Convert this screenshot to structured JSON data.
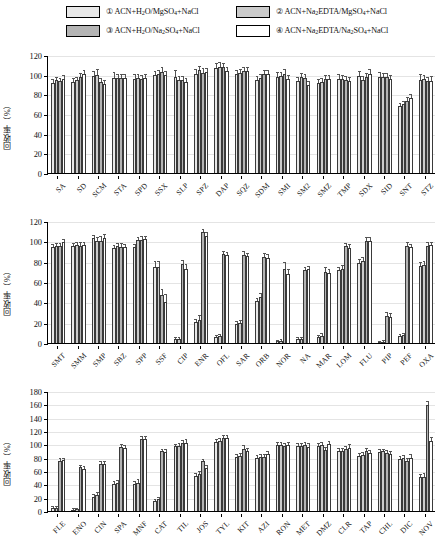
{
  "legend": {
    "items": [
      {
        "id": "1",
        "marker": "①",
        "label": "ACN+H2O/MgSO4+NaCl",
        "html": "① ACN+H<sub>2</sub>O/MgSO<sub>4</sub>+NaCl",
        "color": "#e8e8e8"
      },
      {
        "id": "3",
        "marker": "③",
        "label": "ACN+H2O/Na2SO4+NaCl",
        "html": "③ ACN+H<sub>2</sub>O/Na<sub>2</sub>SO<sub>4</sub>+NaCl",
        "color": "#b4b4b4"
      },
      {
        "id": "2",
        "marker": "②",
        "label": "ACN+Na2EDTA/MgSO4+NaCl",
        "html": "② ACN+Na<sub>2</sub>EDTA/MgSO<sub>4</sub>+NaCl",
        "color": "#cbcbcb"
      },
      {
        "id": "4",
        "marker": "④",
        "label": "ACN+Na2EDTA/Na2SO4+NaCl",
        "html": "④ ACN+Na<sub>2</sub>EDTA/Na<sub>2</sub>SO<sub>4</sub>+NaCl",
        "color": "#ffffff"
      }
    ]
  },
  "series_order": [
    "1",
    "2",
    "3",
    "4"
  ],
  "series_colors": [
    "#e8e8e8",
    "#cbcbcb",
    "#b4b4b4",
    "#ffffff"
  ],
  "ylabel": "回收率（%）",
  "chart_data": [
    {
      "type": "bar",
      "title": "",
      "xlabel": "",
      "ylabel": "回收率（%）",
      "ylim": [
        0,
        120
      ],
      "yticks": [
        0,
        20,
        40,
        60,
        80,
        100,
        120
      ],
      "grid": true,
      "legend_position": "top",
      "categories": [
        "SA",
        "SD",
        "SCM",
        "STA",
        "SPD",
        "SSX",
        "SLP",
        "SPZ",
        "DAP",
        "SQZ",
        "SDM",
        "SMI",
        "SM2",
        "SMZ",
        "TMP",
        "SDX",
        "SID",
        "SNT",
        "STZ"
      ],
      "series": [
        {
          "name": "① ACN+H2O/MgSO4+NaCl",
          "values": [
            91.5,
            93.0,
            98.5,
            97.0,
            96.0,
            99.5,
            98.0,
            101.0,
            107.0,
            100.5,
            95.0,
            98.0,
            93.5,
            92.0,
            96.0,
            99.0,
            98.0,
            68.5,
            95.0
          ]
        },
        {
          "name": "② ACN+Na2EDTA/MgSO4+NaCl",
          "values": [
            94.5,
            94.5,
            100.0,
            96.5,
            96.5,
            101.0,
            94.5,
            104.5,
            108.0,
            102.0,
            97.0,
            98.5,
            97.5,
            93.0,
            96.0,
            95.0,
            98.0,
            70.5,
            95.5
          ]
        },
        {
          "name": "③ ACN+H2O/Na2SO4+NaCl",
          "values": [
            93.5,
            97.5,
            92.5,
            97.0,
            95.5,
            103.0,
            94.5,
            102.0,
            107.5,
            103.5,
            101.0,
            101.0,
            96.5,
            95.5,
            94.5,
            97.5,
            97.5,
            73.5,
            94.0
          ]
        },
        {
          "name": "④ ACN+Na2EDTA/Na2SO4+NaCl",
          "values": [
            96.0,
            100.5,
            91.0,
            96.5,
            96.5,
            100.0,
            93.0,
            103.0,
            104.0,
            103.5,
            100.5,
            96.0,
            89.5,
            96.0,
            94.0,
            100.5,
            95.5,
            76.0,
            94.0
          ]
        }
      ],
      "errors": [
        [
          3.0,
          2.5,
          4.0,
          5.0,
          4.0,
          3.5,
          5.5,
          3.5,
          3.5,
          3.0,
          3.0,
          3.5,
          3.0,
          3.0,
          3.5,
          4.0,
          4.0,
          2.0,
          5.0
        ],
        [
          2.5,
          2.5,
          4.5,
          3.0,
          3.0,
          3.0,
          3.5,
          3.5,
          3.5,
          3.0,
          3.0,
          3.0,
          3.0,
          3.0,
          3.0,
          3.0,
          3.0,
          2.0,
          3.5
        ],
        [
          2.5,
          3.0,
          3.0,
          3.0,
          3.0,
          4.0,
          3.5,
          3.5,
          3.5,
          3.0,
          3.0,
          3.5,
          3.0,
          3.0,
          3.0,
          3.0,
          3.5,
          2.5,
          3.0
        ],
        [
          2.5,
          3.0,
          3.0,
          3.0,
          3.0,
          3.0,
          3.0,
          3.0,
          3.0,
          3.5,
          3.0,
          3.0,
          3.0,
          3.0,
          3.0,
          4.0,
          3.0,
          3.5,
          3.5
        ]
      ]
    },
    {
      "type": "bar",
      "title": "",
      "xlabel": "",
      "ylabel": "回收率（%）",
      "ylim": [
        0,
        120
      ],
      "yticks": [
        0,
        20,
        40,
        60,
        80,
        100,
        120
      ],
      "grid": true,
      "legend_position": "top",
      "categories": [
        "SMT",
        "SMM",
        "SMP",
        "SBZ",
        "SPP",
        "SSF",
        "CIP",
        "ENR",
        "OFL",
        "SAR",
        "ORB",
        "NOR",
        "NA",
        "MAR",
        "LOM",
        "FLU",
        "PIP",
        "PEF",
        "OXA"
      ],
      "series": [
        {
          "name": "① ACN+H2O/MgSO4+NaCl",
          "values": [
            94.5,
            95.5,
            103.0,
            93.0,
            94.0,
            74.5,
            3.5,
            20.5,
            6.0,
            19.0,
            41.0,
            1.5,
            3.5,
            5.5,
            71.5,
            79.0,
            0.8,
            6.5,
            75.5
          ]
        },
        {
          "name": "② ACN+Na2EDTA/MgSO4+NaCl",
          "values": [
            95.0,
            96.5,
            100.5,
            95.0,
            101.0,
            75.0,
            4.0,
            22.5,
            6.5,
            20.0,
            45.0,
            2.0,
            3.5,
            7.0,
            73.0,
            80.5,
            1.0,
            7.5,
            76.5
          ]
        },
        {
          "name": "③ ACN+H2O/Na2SO4+NaCl",
          "values": [
            95.0,
            95.5,
            100.5,
            94.5,
            101.5,
            47.0,
            77.5,
            109.5,
            87.5,
            86.5,
            85.0,
            72.5,
            71.5,
            69.5,
            95.0,
            100.5,
            26.5,
            95.5,
            95.5
          ]
        },
        {
          "name": "④ ACN+Na2EDTA/Na2SO4+NaCl",
          "values": [
            99.0,
            96.0,
            103.0,
            94.5,
            102.0,
            40.5,
            73.0,
            105.5,
            87.0,
            85.5,
            84.0,
            67.5,
            72.5,
            68.5,
            93.5,
            100.5,
            26.0,
            94.0,
            96.0
          ]
        }
      ],
      "errors": [
        [
          2.0,
          2.0,
          2.5,
          2.0,
          2.0,
          5.0,
          1.0,
          2.5,
          1.0,
          1.5,
          2.0,
          0.8,
          1.0,
          1.5,
          2.5,
          3.0,
          0.5,
          1.5,
          3.0
        ],
        [
          2.0,
          2.0,
          3.0,
          2.0,
          2.5,
          5.0,
          1.0,
          4.0,
          1.0,
          1.5,
          3.5,
          0.8,
          1.0,
          1.5,
          2.5,
          3.0,
          0.5,
          1.5,
          3.0
        ],
        [
          2.0,
          2.5,
          3.5,
          2.5,
          2.5,
          5.5,
          3.5,
          2.0,
          2.0,
          3.0,
          2.5,
          6.0,
          2.0,
          4.0,
          2.5,
          2.5,
          3.0,
          2.5,
          2.5
        ],
        [
          2.0,
          2.0,
          3.0,
          2.0,
          2.0,
          6.5,
          3.5,
          2.5,
          2.0,
          2.5,
          2.5,
          4.5,
          2.5,
          3.5,
          2.5,
          2.5,
          3.0,
          2.0,
          2.0
        ]
      ]
    },
    {
      "type": "bar",
      "title": "",
      "xlabel": "",
      "ylabel": "回收率（%）",
      "ylim": [
        0,
        180
      ],
      "yticks": [
        0,
        20,
        40,
        60,
        80,
        100,
        120,
        140,
        160,
        180
      ],
      "grid": true,
      "legend_position": "top",
      "categories": [
        "FLE",
        "ENO",
        "CIN",
        "SPA",
        "MNF",
        "CAT",
        "TIL",
        "JOS",
        "TYL",
        "KIT",
        "AZI",
        "RON",
        "MET",
        "DMZ",
        "CLR",
        "TAP",
        "CHL",
        "DIC",
        "NOV"
      ],
      "series": [
        {
          "name": "① ACN+H2O/MgSO4+NaCl",
          "values": [
            4.5,
            2.0,
            21.5,
            40.0,
            40.0,
            15.5,
            97.0,
            53.0,
            103.0,
            81.5,
            80.0,
            98.5,
            97.5,
            97.5,
            90.5,
            83.0,
            88.5,
            78.5,
            50.5
          ]
        },
        {
          "name": "② ACN+Na2EDTA/MgSO4+NaCl",
          "values": [
            5.0,
            2.5,
            24.0,
            41.5,
            42.5,
            17.5,
            98.0,
            55.5,
            104.5,
            82.5,
            81.0,
            98.5,
            98.0,
            98.5,
            90.5,
            84.5,
            89.5,
            79.0,
            51.5
          ]
        },
        {
          "name": "③ ACN+H2O/Na2SO4+NaCl",
          "values": [
            75.0,
            65.5,
            70.5,
            96.5,
            108.5,
            89.5,
            101.5,
            74.5,
            109.0,
            93.5,
            81.0,
            97.5,
            99.0,
            92.0,
            93.0,
            90.0,
            86.5,
            75.0,
            158.5
          ]
        },
        {
          "name": "④ ACN+Na2EDTA/Na2SO4+NaCl",
          "values": [
            76.0,
            63.5,
            70.5,
            95.0,
            108.0,
            89.0,
            102.5,
            64.5,
            110.0,
            90.0,
            85.5,
            99.0,
            96.5,
            100.0,
            94.5,
            87.0,
            85.0,
            80.0,
            104.5
          ]
        }
      ],
      "errors": [
        [
          1.5,
          0.8,
          2.0,
          3.0,
          3.0,
          1.5,
          2.5,
          2.0,
          3.0,
          3.0,
          2.5,
          3.5,
          3.0,
          3.0,
          3.0,
          2.5,
          2.5,
          3.0,
          4.0
        ],
        [
          1.5,
          0.8,
          3.5,
          3.5,
          3.5,
          1.5,
          3.0,
          3.5,
          3.0,
          3.5,
          2.5,
          3.5,
          3.0,
          3.0,
          3.0,
          3.0,
          2.5,
          3.0,
          4.0
        ],
        [
          2.5,
          2.5,
          2.5,
          3.0,
          2.5,
          2.5,
          3.0,
          2.5,
          3.0,
          3.5,
          3.0,
          3.5,
          3.0,
          3.0,
          3.0,
          2.5,
          3.0,
          3.5,
          5.0
        ],
        [
          2.5,
          2.5,
          2.5,
          2.5,
          3.0,
          2.5,
          3.5,
          2.5,
          3.0,
          2.5,
          3.5,
          3.5,
          3.5,
          3.5,
          4.0,
          3.0,
          3.5,
          3.5,
          5.0
        ]
      ]
    }
  ]
}
